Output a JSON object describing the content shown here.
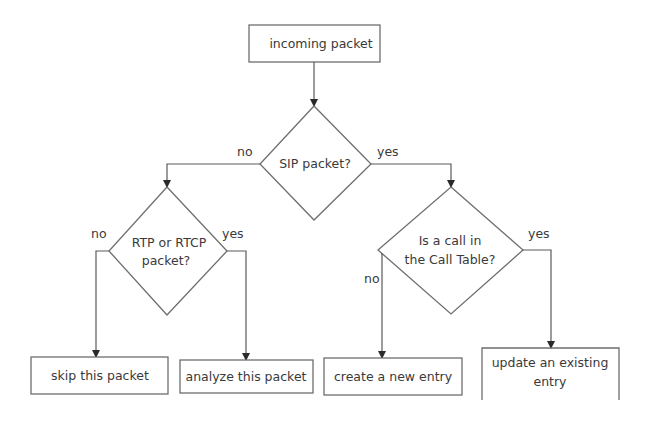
{
  "diagram": {
    "type": "flowchart",
    "nodes": {
      "start": {
        "label": "incoming packet",
        "shape": "rectangle"
      },
      "sip": {
        "label": "SIP packet?",
        "shape": "diamond"
      },
      "rtp": {
        "label_line1": "RTP or RTCP",
        "label_line2": "packet?",
        "shape": "diamond"
      },
      "calltable": {
        "label_line1": "Is a call in",
        "label_line2": "the Call Table?",
        "shape": "diamond"
      },
      "skip": {
        "label": "skip this packet",
        "shape": "rectangle"
      },
      "analyze": {
        "label": "analyze this packet",
        "shape": "rectangle"
      },
      "create": {
        "label": "create a new entry",
        "shape": "rectangle"
      },
      "update": {
        "label_line1": "update an existing",
        "label_line2": "entry",
        "shape": "rectangle"
      }
    },
    "edges": {
      "start_to_sip": {
        "label": ""
      },
      "sip_no": {
        "label": "no"
      },
      "sip_yes": {
        "label": "yes"
      },
      "rtp_no": {
        "label": "no"
      },
      "rtp_yes": {
        "label": "yes"
      },
      "calltable_no": {
        "label": "no"
      },
      "calltable_yes": {
        "label": "yes"
      }
    }
  },
  "colors": {
    "background": "#ffffff",
    "stroke": "#6e6e6e",
    "text": "#3a3a3a"
  }
}
